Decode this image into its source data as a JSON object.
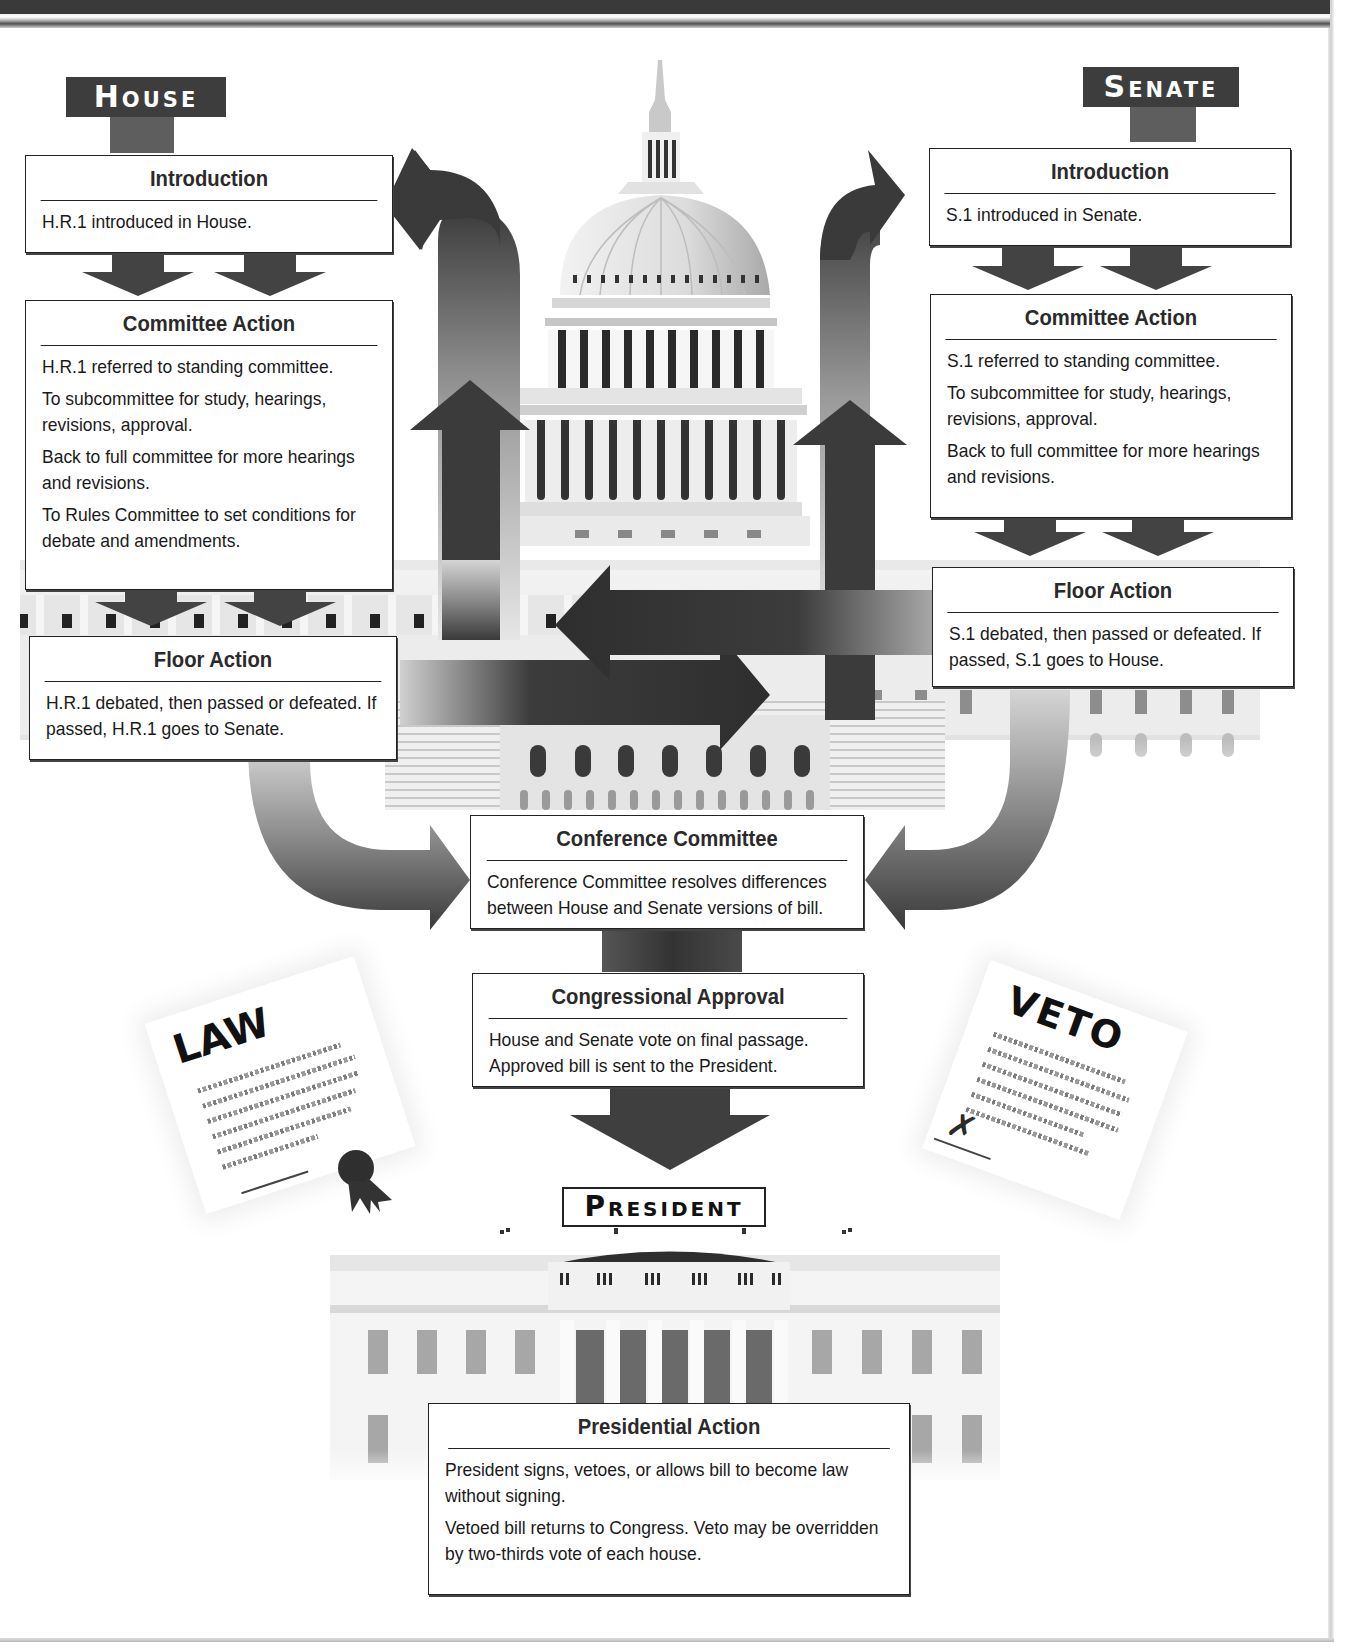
{
  "header": {
    "bar_color": "#3a3a3a"
  },
  "labels": {
    "house": "House",
    "senate": "Senate",
    "president": "President"
  },
  "house": {
    "introduction": {
      "title": "Introduction",
      "lines": [
        "H.R.1 introduced in House."
      ]
    },
    "committee_action": {
      "title": "Committee Action",
      "lines": [
        "H.R.1 referred to standing committee.",
        "To subcommittee for study, hearings, revisions, approval.",
        "Back to full committee for more hearings and revisions.",
        "To Rules Committee to set conditions for debate and amendments."
      ]
    },
    "floor_action": {
      "title": "Floor Action",
      "lines": [
        "H.R.1 debated, then passed or defeated. If passed, H.R.1 goes to Senate."
      ]
    }
  },
  "senate": {
    "introduction": {
      "title": "Introduction",
      "lines": [
        "S.1 introduced in Senate."
      ]
    },
    "committee_action": {
      "title": "Committee Action",
      "lines": [
        "S.1 referred to standing committee.",
        "To subcommittee for study, hearings, revisions, approval.",
        "Back to full committee for more hearings and revisions."
      ]
    },
    "floor_action": {
      "title": "Floor Action",
      "lines": [
        "S.1 debated, then passed or defeated. If passed, S.1 goes to House."
      ]
    }
  },
  "conference_committee": {
    "title": "Conference Committee",
    "lines": [
      "Conference Committee resolves differences between House and Senate versions of bill."
    ]
  },
  "congressional_approval": {
    "title": "Congressional Approval",
    "lines": [
      "House and Senate vote on final passage. Approved bill is sent to the President."
    ]
  },
  "presidential_action": {
    "title": "Presidential Action",
    "lines": [
      "President signs, vetoes, or allows bill to become law without signing.",
      "Vetoed bill returns to Congress. Veto may be overridden by two-thirds vote of each house."
    ]
  },
  "documents": {
    "law": "LAW",
    "veto": "VETO"
  },
  "colors": {
    "arrow_dark": "#3c3c3c",
    "arrow_light": "#d8d8d8",
    "box_border": "#222222"
  }
}
